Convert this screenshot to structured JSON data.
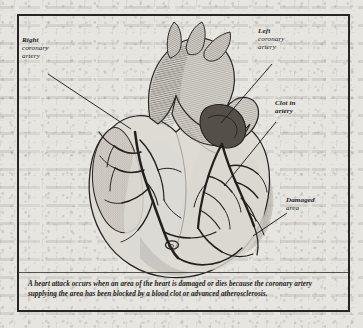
{
  "figure": {
    "caption": "A heart attack occurs when an area of the heart is damaged or dies because the coronary artery supplying the area has been blocked by a blood clot or advanced atherosclerosis.",
    "frame_color": "#282624",
    "paper_color": "#e7e5e0",
    "ink_color": "#201e1c"
  },
  "labels": {
    "right_coronary": {
      "lead": "Right",
      "rest": "coronary\nartery",
      "line1": "coronary",
      "line2": "artery"
    },
    "left_coronary": {
      "lead": "Left",
      "line1": "coronary",
      "line2": "artery"
    },
    "clot": {
      "lead": "Clot in",
      "line1": "artery"
    },
    "damaged": {
      "lead": "Damaged",
      "line1": "area"
    }
  },
  "illustration": {
    "type": "anatomical-line-engraving",
    "subject": "human heart, anterior view",
    "parts": [
      "aortic arch",
      "brachiocephalic trunk",
      "left common carotid artery",
      "left subclavian artery",
      "pulmonary trunk",
      "right atrium",
      "right ventricle",
      "left ventricle",
      "right coronary artery",
      "left coronary artery",
      "anterior interventricular branch",
      "coronary artery clot",
      "infarcted (damaged) myocardium"
    ],
    "shading": {
      "vessel_hatching": "#4a4641",
      "clot_fill": "#55504a",
      "damaged_area_fill": "#a8a49d",
      "muscle_fill": "#dedbd5",
      "outline": "#242220"
    }
  }
}
